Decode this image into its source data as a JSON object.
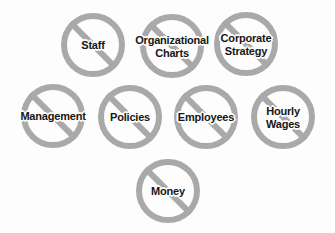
{
  "diagram": {
    "type": "prohibition-signs-cluster",
    "background_color": "#fdfdfd",
    "ring_color": "#a9a9a9",
    "text_color": "#161616",
    "title": "",
    "signs": [
      {
        "id": "staff",
        "label": "Staff",
        "icon": "no-entry-icon",
        "center_x": 93,
        "center_y": 45,
        "radius": 32,
        "rows": [
          "Staff"
        ]
      },
      {
        "id": "organizational-charts",
        "label": "Organizational\nCharts",
        "icon": "no-entry-icon",
        "center_x": 172,
        "center_y": 46,
        "radius": 32,
        "rows": [
          "Organizational",
          "Charts"
        ]
      },
      {
        "id": "corporate-strategy",
        "label": "Corporate\nStrategy",
        "icon": "no-entry-icon",
        "center_x": 246,
        "center_y": 44,
        "radius": 32,
        "rows": [
          "Corporate",
          "Strategy"
        ]
      },
      {
        "id": "management",
        "label": "Management",
        "icon": "no-entry-icon",
        "center_x": 53,
        "center_y": 116,
        "radius": 32,
        "rows": [
          "Management"
        ]
      },
      {
        "id": "policies",
        "label": "Policies",
        "icon": "no-entry-icon",
        "center_x": 130,
        "center_y": 117,
        "radius": 32,
        "rows": [
          "Policies"
        ]
      },
      {
        "id": "employees",
        "label": "Employees",
        "icon": "no-entry-icon",
        "center_x": 206,
        "center_y": 117,
        "radius": 32,
        "rows": [
          "Employees"
        ]
      },
      {
        "id": "hourly-wages",
        "label": "Hourly\nWages",
        "icon": "no-entry-icon",
        "center_x": 283,
        "center_y": 117,
        "radius": 32,
        "rows": [
          "Hourly",
          "Wages"
        ]
      },
      {
        "id": "money",
        "label": "Money",
        "icon": "no-entry-icon",
        "center_x": 168,
        "center_y": 191,
        "radius": 32,
        "rows": [
          "Money"
        ]
      }
    ]
  }
}
